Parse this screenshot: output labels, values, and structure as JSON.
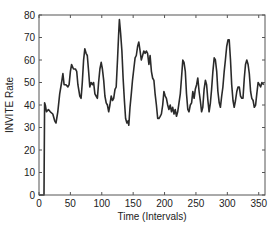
{
  "chart_data": {
    "type": "line",
    "title": "",
    "xlabel": "Time (Intervals)",
    "ylabel": "INVITE Rate",
    "xlim": [
      0,
      360
    ],
    "ylim": [
      0,
      80
    ],
    "xticks": [
      0,
      50,
      100,
      150,
      200,
      250,
      300,
      350
    ],
    "yticks": [
      0,
      10,
      20,
      30,
      40,
      50,
      60,
      70,
      80
    ],
    "grid": false,
    "legend": null,
    "series": [
      {
        "name": "INVITE Rate",
        "color": "#2a2a2a",
        "x": [
          0,
          8,
          9,
          10,
          12,
          15,
          18,
          22,
          25,
          27,
          30,
          33,
          36,
          38,
          40,
          43,
          46,
          48,
          50,
          52,
          55,
          58,
          60,
          62,
          65,
          67,
          69,
          71,
          73,
          75,
          77,
          79,
          81,
          83,
          85,
          87,
          89,
          91,
          93,
          95,
          97,
          99,
          101,
          103,
          105,
          107,
          109,
          111,
          113,
          115,
          117,
          119,
          121,
          123,
          125,
          127,
          128,
          130,
          132,
          134,
          136,
          138,
          140,
          142,
          143,
          145,
          147,
          149,
          151,
          153,
          155,
          157,
          159,
          161,
          163,
          165,
          167,
          169,
          171,
          173,
          175,
          177,
          179,
          181,
          183,
          185,
          187,
          189,
          191,
          193,
          195,
          197,
          199,
          201,
          203,
          205,
          207,
          209,
          211,
          213,
          215,
          217,
          219,
          221,
          223,
          225,
          227,
          229,
          231,
          233,
          235,
          237,
          239,
          241,
          243,
          245,
          247,
          249,
          251,
          253,
          255,
          257,
          259,
          261,
          263,
          265,
          267,
          269,
          271,
          273,
          275,
          277,
          279,
          281,
          283,
          285,
          287,
          289,
          291,
          293,
          295,
          297,
          299,
          301,
          303,
          305,
          307,
          309,
          311,
          313,
          315,
          317,
          319,
          321,
          323,
          325,
          327,
          329,
          331,
          333,
          335,
          337,
          339,
          341,
          343,
          345,
          347,
          349,
          351,
          353,
          355,
          358
        ],
        "y": [
          0,
          0,
          41,
          40,
          37,
          38,
          37,
          36,
          33,
          32,
          37,
          45,
          50,
          54,
          49,
          49,
          48,
          49,
          55,
          58,
          56,
          56,
          55,
          49,
          44,
          43,
          50,
          60,
          65,
          63,
          62,
          55,
          48,
          50,
          49,
          50,
          45,
          44,
          43,
          50,
          56,
          59,
          56,
          51,
          44,
          41,
          40,
          37,
          40,
          44,
          42,
          43,
          47,
          48,
          60,
          72,
          78,
          72,
          64,
          52,
          42,
          34,
          32,
          33,
          31,
          39,
          45,
          51,
          56,
          61,
          62,
          66,
          68,
          64,
          60,
          62,
          64,
          63,
          64,
          63,
          58,
          62,
          55,
          52,
          51,
          45,
          40,
          34,
          34,
          35,
          36,
          40,
          46,
          44,
          43,
          40,
          38,
          40,
          37,
          39,
          36,
          38,
          35,
          37,
          41,
          45,
          52,
          60,
          59,
          55,
          45,
          38,
          37,
          40,
          41,
          46,
          43,
          47,
          49,
          52,
          46,
          42,
          37,
          39,
          47,
          51,
          49,
          42,
          37,
          41,
          47,
          55,
          61,
          60,
          55,
          46,
          41,
          39,
          44,
          48,
          55,
          60,
          66,
          69,
          69,
          60,
          49,
          42,
          39,
          42,
          46,
          48,
          48,
          44,
          43,
          43,
          52,
          58,
          60,
          58,
          54,
          46,
          43,
          42,
          39,
          40,
          45,
          50,
          49,
          48,
          50,
          49
        ]
      }
    ]
  },
  "axes": {
    "xlabel": "Time (Intervals)",
    "ylabel": "INVITE Rate",
    "xtick_labels": [
      "0",
      "50",
      "100",
      "150",
      "200",
      "250",
      "300",
      "350"
    ],
    "ytick_labels": [
      "0",
      "10",
      "20",
      "30",
      "40",
      "50",
      "60",
      "70",
      "80"
    ]
  }
}
